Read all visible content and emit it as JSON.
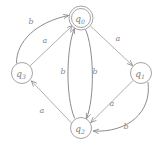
{
  "diagram": {
    "type": "finite-state-automaton",
    "canvas": {
      "width": 162,
      "height": 149
    },
    "colors": {
      "background": "#ffffff",
      "node_stroke": "#9a9a9a",
      "edge_stroke": "#a6a6a6",
      "edge_stroke_dark": "#8c8c8c",
      "label_text": "#7c7c7c",
      "edge_label_text": "#8a8a8a"
    },
    "states": [
      {
        "id": "q0",
        "name": "q",
        "subscript": "0",
        "accepting": true,
        "cx": 81,
        "cy": 18,
        "r_outer": 12,
        "r_inner": 9.5
      },
      {
        "id": "q3",
        "name": "q",
        "subscript": "3",
        "accepting": false,
        "cx": 22,
        "cy": 73,
        "r_outer": 10.5,
        "r_inner": 0
      },
      {
        "id": "q1",
        "name": "q",
        "subscript": "1",
        "accepting": false,
        "cx": 141,
        "cy": 73,
        "r_outer": 10.5,
        "r_inner": 0
      },
      {
        "id": "q2",
        "name": "q",
        "subscript": "2",
        "accepting": false,
        "cx": 81,
        "cy": 128,
        "r_outer": 10.5,
        "r_inner": 0
      }
    ],
    "transitions": [
      {
        "id": "q3-q0-b",
        "from": "q3",
        "to": "q0",
        "symbol": "b",
        "shape": "curved",
        "label_x": 31,
        "label_y": 21,
        "path": "M 16.5 63 C 16 42 36 22 68.5 15.5",
        "arrow_x": 68.5,
        "arrow_y": 15.5,
        "arrow_angle": -12
      },
      {
        "id": "q3-q0-a",
        "from": "q3",
        "to": "q0",
        "symbol": "a",
        "shape": "straight",
        "label_x": 45,
        "label_y": 40,
        "path": "M 30.5 65.5 L 72.5 25.5",
        "arrow_x": 72.5,
        "arrow_y": 25.5,
        "arrow_angle": -43.6
      },
      {
        "id": "q0-q1-a",
        "from": "q0",
        "to": "q1",
        "symbol": "a",
        "shape": "straight",
        "label_x": 118,
        "label_y": 38,
        "path": "M 90.5 26 L 132.5 65.5",
        "arrow_x": 132.5,
        "arrow_y": 65.5,
        "arrow_angle": 43.2
      },
      {
        "id": "q2-q0-b",
        "from": "q2",
        "to": "q0",
        "symbol": "b",
        "shape": "curved",
        "label_x": 63,
        "label_y": 71,
        "path": "M 74.5 118 C 65 96 66.5 46 74.5 28.5",
        "arrow_x": 74.5,
        "arrow_y": 28.5,
        "arrow_angle": -65
      },
      {
        "id": "q0-q2-b",
        "from": "q0",
        "to": "q2",
        "symbol": "b",
        "shape": "curved",
        "label_x": 95,
        "label_y": 71,
        "path": "M 85.5 29.5 C 94 48 95 98 86.5 118.5",
        "arrow_x": 86.5,
        "arrow_y": 118.5,
        "arrow_angle": 113
      },
      {
        "id": "q2-q3-a",
        "from": "q2",
        "to": "q3",
        "symbol": "a",
        "shape": "straight",
        "label_x": 42,
        "label_y": 110,
        "path": "M 71.5 123 L 31.5 81",
        "arrow_x": 31.5,
        "arrow_y": 81,
        "arrow_angle": -133.6
      },
      {
        "id": "q1-q2-a",
        "from": "q1",
        "to": "q2",
        "symbol": "a",
        "shape": "straight",
        "label_x": 112,
        "label_y": 103,
        "path": "M 133 80.5 L 91 122.5",
        "arrow_x": 91,
        "arrow_y": 122.5,
        "arrow_angle": 135
      },
      {
        "id": "q1-q2-b",
        "from": "q1",
        "to": "q2",
        "symbol": "b",
        "shape": "curved",
        "label_x": 126,
        "label_y": 126,
        "path": "M 148 82.5 C 152 112 128 133 93.5 131",
        "arrow_x": 93.5,
        "arrow_y": 131,
        "arrow_angle": 183
      }
    ]
  }
}
